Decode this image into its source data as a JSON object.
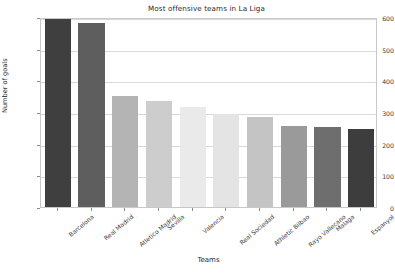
{
  "chart_data": {
    "type": "bar",
    "title": "Most offensive teams in La Liga",
    "xlabel": "Teams",
    "ylabel": "Number of goals",
    "categories": [
      "Barcelona",
      "Real Madrid",
      "Atletico Madrid",
      "Sevilla",
      "Valencia",
      "Real Sociedad",
      "Athletic Bilbao",
      "Rayo Vallecano",
      "Malaga",
      "Espanyol"
    ],
    "values": [
      595,
      580,
      350,
      335,
      315,
      295,
      285,
      255,
      252,
      245
    ],
    "bar_colors": [
      "#3f3f3f",
      "#5e5e5e",
      "#b4b4b4",
      "#cdcdcd",
      "#eaeaea",
      "#e4e4e4",
      "#c4c4c4",
      "#9a9a9a",
      "#6e6e6e",
      "#3d3d3d"
    ],
    "yticks": [
      0,
      100,
      200,
      300,
      400,
      500,
      600
    ],
    "ytick_labels": [
      "0",
      "100",
      "200",
      "300",
      "400",
      "500",
      "600"
    ],
    "ylim": [
      0,
      600
    ],
    "grid": true,
    "grid_axis": "y",
    "legend": false,
    "axes_frame_color": "#c8c8c8",
    "background_color": "#ffffff"
  }
}
